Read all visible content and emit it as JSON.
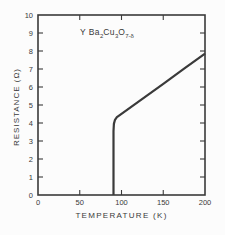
{
  "figure": {
    "kind": "scanned line chart from a physics paper",
    "bg_color": "#fcfcfc",
    "line_color": "#3a3a3a",
    "text_color": "#3a3a3a",
    "title_plain": "Y Ba2Cu3O7-δ",
    "title_parts": [
      {
        "text": "Y Ba"
      },
      {
        "sub": "2"
      },
      {
        "text": "Cu"
      },
      {
        "sub": "3"
      },
      {
        "text": "O"
      },
      {
        "sub": "7-δ"
      }
    ]
  },
  "chart_data": {
    "type": "line",
    "title": "Y Ba2Cu3O7-δ",
    "xlabel": "TEMPERATURE  (K)",
    "ylabel": "RESISTANCE  (Ω)",
    "xlim": [
      0,
      200
    ],
    "ylim": [
      0,
      10
    ],
    "x_ticks": [
      0,
      50,
      100,
      150,
      200
    ],
    "x_tick_labels": [
      "0",
      "50",
      "100",
      "150",
      "200"
    ],
    "y_ticks": [
      0,
      1,
      2,
      3,
      4,
      5,
      6,
      7,
      8,
      9,
      10
    ],
    "y_tick_labels": [
      "0",
      "1",
      "2",
      "3",
      "4",
      "5",
      "6",
      "7",
      "8",
      "9",
      "10"
    ],
    "grid": false,
    "legend": null,
    "frame": "box with inward ticks on all four sides",
    "series": [
      {
        "name": "resistance-vs-temperature",
        "color": "#3a3a3a",
        "points": [
          [
            90.4,
            0.0
          ],
          [
            90.4,
            3.55
          ],
          [
            90.9,
            3.95
          ],
          [
            92.2,
            4.18
          ],
          [
            94.5,
            4.33
          ],
          [
            97.5,
            4.43
          ],
          [
            120.0,
            5.18
          ],
          [
            150.0,
            6.18
          ],
          [
            175.0,
            7.02
          ],
          [
            200.0,
            7.85
          ]
        ]
      }
    ]
  }
}
